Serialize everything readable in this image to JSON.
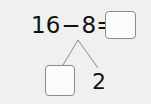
{
  "problem": {
    "minuend": "16",
    "operator": "−",
    "subtrahend": "8",
    "equals": "=",
    "answer_value": ""
  },
  "decomposition": {
    "part_unknown_value": "",
    "part_known": "2"
  },
  "colors": {
    "background": "#f0f0f0",
    "box_fill": "#fbfbfb",
    "box_border": "#8a8a8a",
    "line": "#8a8a8a",
    "text": "#111111"
  }
}
